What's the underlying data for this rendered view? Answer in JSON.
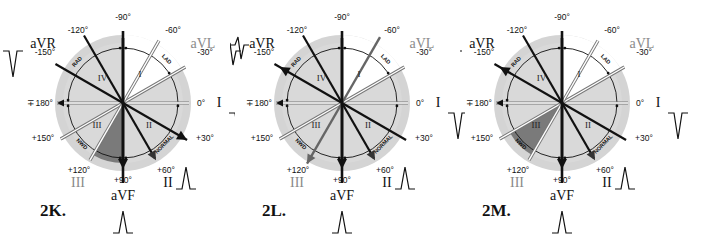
{
  "figure": "ECG hexaxial reference system — frontal plane QRS axis",
  "panels": [
    {
      "id": "2K",
      "label": "2K.",
      "sectors": {
        "I": "#ffffff",
        "II": "#d9d9d9",
        "III": "#d9d9d9",
        "IV": "#d9d9d9"
      },
      "dark_wedge_deg": [
        90,
        120
      ],
      "arrow_leads": [
        "aVF",
        "II",
        "I_neg30"
      ],
      "heavy_leads": [
        "aVR",
        "II",
        "aVF",
        "-120"
      ],
      "waveforms": {
        "aVR": "neg",
        "I": "neg",
        "II": "pos",
        "aVF": "pos"
      },
      "gray_leads": [
        "aVL",
        "III"
      ]
    },
    {
      "id": "2L",
      "label": "2L.",
      "sectors": {
        "I": "#ffffff",
        "II": "#d9d9d9",
        "III": "#d9d9d9",
        "IV": "#d9d9d9"
      },
      "dark_wedge_deg": null,
      "arrow_leads": [
        "aVR",
        "aVF",
        "II",
        "III"
      ],
      "heavy_leads": [
        "aVR",
        "II",
        "aVF",
        "-120"
      ],
      "waveforms": {
        "aVR": "biphasic",
        "I": "neg",
        "II": "pos",
        "aVF": "pos",
        "III": "pos"
      },
      "gray_leads": [
        "aVL",
        "III"
      ]
    },
    {
      "id": "2M",
      "label": "2M.",
      "sectors": {
        "I": "#ffffff",
        "II": "#d9d9d9",
        "III": "#d9d9d9",
        "IV": "#d9d9d9"
      },
      "dark_wedge_deg": [
        120,
        150
      ],
      "arrow_leads": [
        "aVR",
        "aVF",
        "II"
      ],
      "heavy_leads": [
        "aVR",
        "II",
        "aVF",
        "-120"
      ],
      "waveforms": {
        "aVR": "pos",
        "I": "neg",
        "II": "pos",
        "aVF": "pos"
      },
      "gray_leads": [
        "aVL",
        "III"
      ]
    }
  ],
  "degree_labels": {
    "m90": "-90°",
    "m120": "-120°",
    "m60": "-60°",
    "m150": "-150°",
    "m30": "-30°",
    "p180": "∓180°",
    "z0": "0°",
    "p150": "+150°",
    "p30": "+30°",
    "p120": "+120°",
    "p90": "+90°",
    "p60": "+60°"
  },
  "lead_names": {
    "aVR": "aVR",
    "aVL": "aVL",
    "I": "I",
    "II": "II",
    "III": "III",
    "aVF": "aVF"
  },
  "sector_names": [
    "I",
    "II",
    "III",
    "IV"
  ],
  "arc_labels": {
    "lad": "LAD",
    "rad": "RAD",
    "normal": "NORMAL",
    "nwd": "NWD"
  },
  "colors": {
    "outer_ring": "#d4d4d4",
    "sector_gray": "#d9d9d9",
    "dark_wedge": "#7a7a7a",
    "ink": "#111111",
    "gray_lead": "#8a8a8a"
  }
}
